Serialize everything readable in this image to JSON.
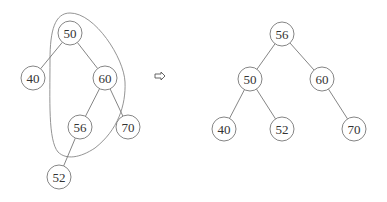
{
  "diagram": {
    "type": "binary-search-tree-rotation",
    "left_tree": {
      "nodes": [
        {
          "id": "L50",
          "label": "50",
          "x": 70,
          "y": 33
        },
        {
          "id": "L40",
          "label": "40",
          "x": 33,
          "y": 78
        },
        {
          "id": "L60",
          "label": "60",
          "x": 105,
          "y": 78
        },
        {
          "id": "L56",
          "label": "56",
          "x": 80,
          "y": 127
        },
        {
          "id": "L70",
          "label": "70",
          "x": 128,
          "y": 127
        },
        {
          "id": "L52",
          "label": "52",
          "x": 59,
          "y": 177
        }
      ],
      "edges": [
        [
          "L50",
          "L40"
        ],
        [
          "L50",
          "L60"
        ],
        [
          "L60",
          "L56"
        ],
        [
          "L60",
          "L70"
        ],
        [
          "L56",
          "L52"
        ]
      ],
      "highlight_loop": "encloses 50, 60, 56"
    },
    "arrow": {
      "symbol": "⇨",
      "x": 160,
      "y": 76
    },
    "right_tree": {
      "nodes": [
        {
          "id": "R56",
          "label": "56",
          "x": 282,
          "y": 34
        },
        {
          "id": "R50",
          "label": "50",
          "x": 250,
          "y": 79
        },
        {
          "id": "R60",
          "label": "60",
          "x": 322,
          "y": 79
        },
        {
          "id": "R40",
          "label": "40",
          "x": 224,
          "y": 129
        },
        {
          "id": "R52",
          "label": "52",
          "x": 282,
          "y": 129
        },
        {
          "id": "R70",
          "label": "70",
          "x": 354,
          "y": 129
        }
      ],
      "edges": [
        [
          "R56",
          "R50"
        ],
        [
          "R56",
          "R60"
        ],
        [
          "R50",
          "R40"
        ],
        [
          "R50",
          "R52"
        ],
        [
          "R60",
          "R70"
        ]
      ]
    },
    "colors": {
      "stroke": "#777777",
      "text": "#333333",
      "background": "#ffffff"
    }
  }
}
